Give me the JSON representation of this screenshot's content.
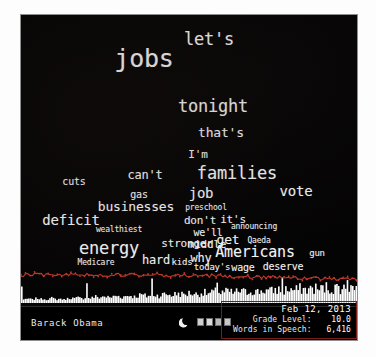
{
  "panel": {
    "background_color": "#050404",
    "accent_color": "#c0392b",
    "text_color": "#f2f2f2"
  },
  "footer": {
    "speaker": "Barack Obama",
    "moon_icon": "crescent-moon-icon",
    "glyphs": [
      "app-glyph-1",
      "app-glyph-2",
      "app-glyph-3",
      "app-glyph-4"
    ]
  },
  "stats": {
    "date": "Feb 12, 2013",
    "grade_level_label": "Grade Level:",
    "grade_level_value": "10.0",
    "words_label": "Words in Speech:",
    "words_value": "6,416"
  },
  "chart_data": {
    "type": "wordcloud",
    "speaker": "Barack Obama",
    "date": "Feb 12, 2013",
    "grade_level": 10.0,
    "words_in_speech": 6416,
    "words": [
      {
        "text": "let's",
        "size": 17,
        "x": 188,
        "y": 24
      },
      {
        "text": "jobs",
        "size": 25,
        "x": 123,
        "y": 43
      },
      {
        "text": "tonight",
        "size": 17,
        "x": 192,
        "y": 91
      },
      {
        "text": "that's",
        "size": 13,
        "x": 200,
        "y": 117
      },
      {
        "text": "I'm",
        "size": 11,
        "x": 177,
        "y": 139
      },
      {
        "text": "families",
        "size": 17,
        "x": 216,
        "y": 158
      },
      {
        "text": "cuts",
        "size": 10,
        "x": 53,
        "y": 166
      },
      {
        "text": "can't",
        "size": 12,
        "x": 124,
        "y": 160
      },
      {
        "text": "gas",
        "size": 10,
        "x": 118,
        "y": 179
      },
      {
        "text": "job",
        "size": 14,
        "x": 180,
        "y": 178
      },
      {
        "text": "vote",
        "size": 14,
        "x": 275,
        "y": 176
      },
      {
        "text": "businesses",
        "size": 13,
        "x": 115,
        "y": 191
      },
      {
        "text": "preschool",
        "size": 8,
        "x": 185,
        "y": 192
      },
      {
        "text": "deficit",
        "size": 14,
        "x": 50,
        "y": 205
      },
      {
        "text": "don't",
        "size": 11,
        "x": 179,
        "y": 205
      },
      {
        "text": "it's",
        "size": 11,
        "x": 212,
        "y": 204
      },
      {
        "text": "announcing",
        "size": 8,
        "x": 233,
        "y": 211
      },
      {
        "text": "wealthiest",
        "size": 8,
        "x": 98,
        "y": 214
      },
      {
        "text": "we'll",
        "size": 10,
        "x": 187,
        "y": 217
      },
      {
        "text": "get",
        "size": 13,
        "x": 207,
        "y": 224
      },
      {
        "text": "Qaeda",
        "size": 8,
        "x": 238,
        "y": 225
      },
      {
        "text": "energy",
        "size": 17,
        "x": 88,
        "y": 233
      },
      {
        "text": "stronger",
        "size": 11,
        "x": 166,
        "y": 228
      },
      {
        "text": "middle",
        "size": 11,
        "x": 186,
        "y": 229
      },
      {
        "text": "Americans",
        "size": 15,
        "x": 234,
        "y": 237
      },
      {
        "text": "gun",
        "size": 9,
        "x": 296,
        "y": 238
      },
      {
        "text": "hard",
        "size": 12,
        "x": 135,
        "y": 245
      },
      {
        "text": "kids",
        "size": 9,
        "x": 161,
        "y": 247
      },
      {
        "text": "why",
        "size": 12,
        "x": 180,
        "y": 243
      },
      {
        "text": "Medicare",
        "size": 8,
        "x": 75,
        "y": 247
      },
      {
        "text": "today's",
        "size": 9,
        "x": 191,
        "y": 252
      },
      {
        "text": "wage",
        "size": 10,
        "x": 222,
        "y": 252
      },
      {
        "text": "deserve",
        "size": 10,
        "x": 262,
        "y": 251
      }
    ],
    "waveform": {
      "description": "white amplitude histogram with red trend line overlay",
      "bar_color": "#ffffff",
      "line_color": "#c0392b",
      "bars": [
        4,
        3,
        3,
        4,
        5,
        4,
        3,
        4,
        5,
        6,
        5,
        4,
        5,
        4,
        3,
        4,
        5,
        6,
        5,
        4,
        3,
        4,
        5,
        4,
        3,
        4,
        5,
        6,
        7,
        6,
        5,
        6,
        7,
        6,
        5,
        6,
        7,
        8,
        7,
        6,
        7,
        8,
        9,
        8,
        7,
        8,
        9,
        10,
        9,
        8,
        7,
        8,
        9,
        10,
        11,
        10,
        9,
        8,
        9,
        10,
        11,
        12,
        11,
        10,
        9,
        10,
        11,
        12,
        13,
        12,
        11,
        10,
        11,
        12,
        13,
        14,
        13,
        12,
        11,
        12,
        13,
        14,
        15,
        14,
        13,
        12,
        13,
        14,
        15,
        16,
        15,
        14,
        13,
        14,
        15,
        16,
        17,
        16,
        15,
        14,
        15,
        16,
        17,
        18,
        17,
        16,
        15,
        16,
        17,
        18,
        19,
        18,
        17,
        16,
        17,
        18,
        19,
        20,
        19,
        18,
        17,
        18,
        19,
        20,
        21,
        20,
        19,
        18,
        19,
        20,
        21,
        22,
        21,
        20,
        19,
        20,
        21,
        22,
        23,
        22,
        21,
        20,
        21,
        22,
        23,
        24,
        23,
        22,
        21,
        22,
        23,
        24,
        25,
        24,
        23,
        22,
        23,
        24,
        25,
        26,
        25,
        24,
        23,
        24,
        25,
        26,
        27,
        26,
        25,
        24,
        25,
        26,
        27,
        28,
        27,
        26,
        25,
        26,
        27,
        28,
        29,
        28,
        27,
        26,
        27,
        28,
        29,
        30,
        29,
        28,
        27,
        28
      ],
      "trend": [
        26,
        27,
        28,
        27,
        29,
        30,
        31,
        30,
        29,
        30,
        31,
        32,
        31,
        30,
        31,
        32,
        33,
        32,
        31,
        32,
        33,
        34,
        33,
        32,
        33,
        34,
        35,
        34,
        33,
        34
      ]
    }
  }
}
